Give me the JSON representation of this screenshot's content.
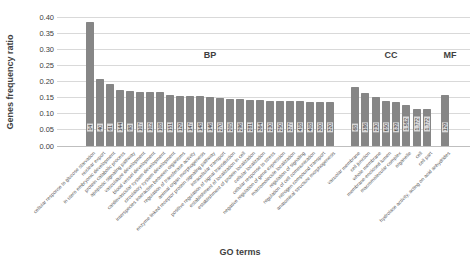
{
  "chart_data": {
    "type": "bar",
    "title": "",
    "xlabel": "GO terms",
    "ylabel": "Genes frequency ratio",
    "ylim": [
      0,
      0.4
    ],
    "ytick_step": 0.05,
    "yticks": [
      "0.00",
      "0.05",
      "0.10",
      "0.15",
      "0.20",
      "0.25",
      "0.30",
      "0.35",
      "0.40"
    ],
    "grid": true,
    "legend_position": "none",
    "bar_color": "#868686",
    "value_label_bg": "#d9d9d9",
    "groups": [
      {
        "name": "BP",
        "bars": [
          {
            "term": "cellular response to glucose starvation",
            "count": "14",
            "value": 0.385
          },
          {
            "term": "nuclear export",
            "count": "40",
            "value": 0.208
          },
          {
            "term": "in utero embryonic development",
            "count": "61",
            "value": 0.192
          },
          {
            "term": "protein catabolic process",
            "count": "144",
            "value": 0.174
          },
          {
            "term": "apoptotic signaling pathway",
            "count": "98",
            "value": 0.172
          },
          {
            "term": "vasculature development",
            "count": "107",
            "value": 0.167
          },
          {
            "term": "blood vessel development",
            "count": "102",
            "value": 0.167
          },
          {
            "term": "cardiovascular system development",
            "count": "108",
            "value": 0.166
          },
          {
            "term": "circulatory system development",
            "count": "151",
            "value": 0.157
          },
          {
            "term": "interspecies interaction between organisms",
            "count": "129",
            "value": 0.156
          },
          {
            "term": "regulation of transferase activity",
            "count": "147",
            "value": 0.155
          },
          {
            "term": "animal organ morphogenesis",
            "count": "148",
            "value": 0.154
          },
          {
            "term": "enzyme linked receptor protein signaling pathway",
            "count": "146",
            "value": 0.152
          },
          {
            "term": "intracellular transport",
            "count": "270",
            "value": 0.149
          },
          {
            "term": "positive regulation of signal transduction",
            "count": "205",
            "value": 0.147
          },
          {
            "term": "establishment of localization in cell",
            "count": "296",
            "value": 0.145
          },
          {
            "term": "establishment of protein localization",
            "count": "281",
            "value": 0.144
          },
          {
            "term": "cellular localization",
            "count": "364",
            "value": 0.143
          },
          {
            "term": "cellular response to stress",
            "count": "230",
            "value": 0.141
          },
          {
            "term": "negative regulation of gene expression",
            "count": "250",
            "value": 0.14
          },
          {
            "term": "macromolecule localization",
            "count": "377",
            "value": 0.139
          },
          {
            "term": "regulation of signaling",
            "count": "418",
            "value": 0.138
          },
          {
            "term": "regulation of cell communication",
            "count": "408",
            "value": 0.137
          },
          {
            "term": "nitrogen compound transport",
            "count": "300",
            "value": 0.136
          },
          {
            "term": "anatomical structure morphogenesis",
            "count": "320",
            "value": 0.135
          }
        ]
      },
      {
        "name": "CC",
        "bars": [
          {
            "term": "vacuolar membrane",
            "count": "68",
            "value": 0.182
          },
          {
            "term": "cell junction",
            "count": "186",
            "value": 0.163
          },
          {
            "term": "whole membrane",
            "count": "230",
            "value": 0.152
          },
          {
            "term": "membrane-enclosed lumen",
            "count": "650",
            "value": 0.138
          },
          {
            "term": "macromolecular complex",
            "count": "639",
            "value": 0.137
          },
          {
            "term": "organelle",
            "count": "1,562",
            "value": 0.126
          },
          {
            "term": "cell",
            "count": "1,772",
            "value": 0.116
          },
          {
            "term": "cell part",
            "count": "1,772",
            "value": 0.115
          }
        ]
      },
      {
        "name": "MF",
        "bars": [
          {
            "term": "hydrolase activity, acting on acid anhydrides",
            "count": "129",
            "value": 0.157
          }
        ]
      }
    ]
  }
}
